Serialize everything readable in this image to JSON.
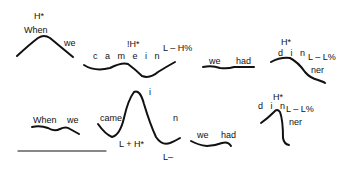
{
  "top_row": {
    "p1": {
      "tone": "H*",
      "word1": "When",
      "word2": "we"
    },
    "p2": {
      "tone": "!H*",
      "words": "c a m e   i n",
      "boundary": "L – H%"
    },
    "p3": {
      "word1": "we",
      "word2": "had"
    },
    "p4": {
      "tone": "H*",
      "syll1": "d i n",
      "boundary": "L – L%",
      "syll2": "ner"
    }
  },
  "bottom_row": {
    "p1": {
      "word1": "When",
      "word2": "we"
    },
    "p2": {
      "word1": "came",
      "peak": "i",
      "word2": "n",
      "tone": "L + H*",
      "phrase": "L–"
    },
    "p3": {
      "word1": "we",
      "word2": "had"
    },
    "p4": {
      "tone": "H*",
      "syll1": "d i n",
      "boundary": "L – L%",
      "syll2": "ner"
    }
  }
}
